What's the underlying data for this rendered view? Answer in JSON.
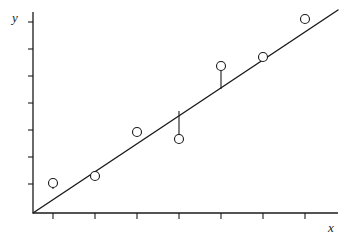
{
  "figure": {
    "title": "",
    "background_color": "#ffffff",
    "ink_color": "#1a1a1a",
    "width": 350,
    "height": 239
  },
  "axes": {
    "x_label": "x",
    "y_label": "y",
    "origin": {
      "x": 33,
      "y": 213
    },
    "x_axis_end": {
      "x": 338,
      "y": 213
    },
    "y_axis_top": {
      "x": 33,
      "y": 12
    },
    "x_tick_count": 7,
    "y_tick_count": 7,
    "x_tick_positions": [
      53,
      95,
      137,
      179,
      221,
      263,
      305
    ],
    "y_tick_positions": [
      22,
      49,
      76,
      103,
      130,
      157,
      184
    ],
    "x_tick_length": 6,
    "y_tick_length": 5,
    "tick_labels": [],
    "grid": false
  },
  "chart_data": {
    "type": "scatter",
    "title": "",
    "xlabel": "x",
    "ylabel": "y",
    "grid": false,
    "legend": false,
    "axis_pixel_ranges": {
      "x": [
        33,
        338
      ],
      "y": [
        213,
        12
      ]
    },
    "x": [
      53,
      95,
      137,
      179,
      221,
      263,
      305
    ],
    "y": [
      183,
      176,
      132,
      139,
      66,
      57,
      19
    ],
    "points": [
      {
        "label": "p1",
        "x": 53,
        "y": 183,
        "on_line": false,
        "residual_sign": "above",
        "line_y": 189
      },
      {
        "label": "p2",
        "x": 95,
        "y": 176,
        "on_line": true,
        "residual_sign": "none",
        "line_y": 177
      },
      {
        "label": "p3",
        "x": 137,
        "y": 132,
        "on_line": true,
        "residual_sign": "none",
        "line_y": 133
      },
      {
        "label": "p4",
        "x": 179,
        "y": 139,
        "on_line": false,
        "residual_sign": "below",
        "line_y": 111
      },
      {
        "label": "p5",
        "x": 221,
        "y": 66,
        "on_line": false,
        "residual_sign": "above",
        "line_y": 89
      },
      {
        "label": "p6",
        "x": 263,
        "y": 57,
        "on_line": true,
        "residual_sign": "none",
        "line_y": 58
      },
      {
        "label": "p7",
        "x": 305,
        "y": 19,
        "on_line": true,
        "residual_sign": "none",
        "line_y": 20
      }
    ],
    "marker": {
      "style": "open-circle",
      "radius": 4.5,
      "fill": "none",
      "stroke": "#1a1a1a",
      "stroke_width": 1.1
    },
    "fit_line": {
      "name": "least-squares fit",
      "style": "solid",
      "stroke": "#1a1a1a",
      "stroke_width": 1.4,
      "start": {
        "x": 33,
        "y": 213
      },
      "end": {
        "x": 338,
        "y": 10
      }
    },
    "residuals": {
      "description": "vertical stems from off-line points to the fitted line",
      "stroke": "#1a1a1a",
      "stroke_width": 1.1,
      "segments": [
        {
          "x": 53,
          "y_point": 183,
          "y_line": 189
        },
        {
          "x": 179,
          "y_point": 139,
          "y_line": 111
        },
        {
          "x": 221,
          "y_point": 66,
          "y_line": 89
        }
      ]
    }
  }
}
